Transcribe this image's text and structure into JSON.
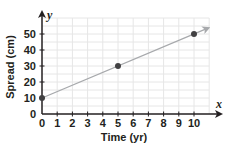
{
  "chart_data": {
    "type": "line",
    "title": "",
    "xlabel": "Time (yr)",
    "ylabel": "Spread (cm)",
    "x_axis_var": "x",
    "y_axis_var": "y",
    "x_ticks": [
      "0",
      "1",
      "2",
      "3",
      "4",
      "5",
      "6",
      "7",
      "8",
      "9",
      "10"
    ],
    "y_ticks": [
      "0",
      "10",
      "20",
      "30",
      "40",
      "50"
    ],
    "xlim": [
      0,
      11
    ],
    "ylim": [
      0,
      60
    ],
    "grid": true,
    "legend": null,
    "series": [
      {
        "name": "Spread",
        "points": [
          {
            "x": 0,
            "y": 10
          },
          {
            "x": 5,
            "y": 30
          },
          {
            "x": 10,
            "y": 50
          }
        ],
        "line": "ray extending beyond x=10 with arrowhead"
      }
    ],
    "colors": {
      "axis": "#231f20",
      "grid": "#e6e6e6",
      "line": "#a7a9ac",
      "point": "#414042"
    }
  }
}
